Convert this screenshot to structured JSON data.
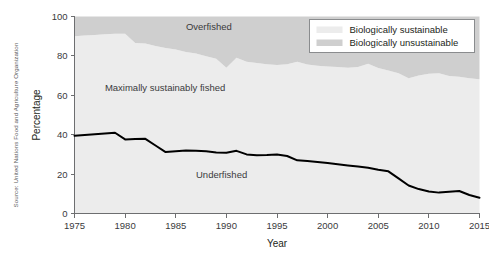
{
  "chart_data": {
    "type": "area",
    "title": "",
    "xlabel": "Year",
    "ylabel": "Percentage",
    "xlim": [
      1975,
      2015
    ],
    "ylim": [
      0,
      100
    ],
    "xticks": [
      1975,
      1980,
      1985,
      1990,
      1995,
      2000,
      2005,
      2010,
      2015
    ],
    "yticks": [
      0,
      20,
      40,
      60,
      80,
      100
    ],
    "grid": false,
    "legend_position": "top-right",
    "source": "Source: United Nations Food and Agriculture Organization",
    "legend": [
      {
        "label": "Biologically sustainable",
        "color": "#ececec"
      },
      {
        "label": "Biologically unsustainable",
        "color": "#cfcfcf"
      }
    ],
    "area_labels": [
      {
        "text": "Overfished",
        "x": 1986,
        "y": 93
      },
      {
        "text": "Maximally sustainably fished",
        "x": 1978,
        "y": 62
      },
      {
        "text": "Underfished",
        "x": 1987,
        "y": 18
      }
    ],
    "x": [
      1975,
      1976,
      1977,
      1978,
      1979,
      1980,
      1981,
      1982,
      1983,
      1984,
      1985,
      1986,
      1987,
      1988,
      1989,
      1990,
      1991,
      1992,
      1993,
      1994,
      1995,
      1996,
      1997,
      1998,
      1999,
      2000,
      2001,
      2002,
      2003,
      2004,
      2005,
      2006,
      2007,
      2008,
      2009,
      2010,
      2011,
      2012,
      2013,
      2014,
      2015
    ],
    "series": [
      {
        "name": "Underfished (upper boundary)",
        "style": "black-line",
        "values": [
          39.5,
          39.8,
          40.2,
          40.6,
          41.0,
          37.6,
          37.8,
          37.9,
          34.5,
          31.2,
          31.6,
          32.0,
          31.8,
          31.6,
          31.0,
          30.8,
          31.8,
          30.0,
          29.6,
          29.7,
          30.0,
          29.2,
          27.0,
          26.6,
          26.2,
          25.6,
          25.0,
          24.4,
          23.8,
          23.2,
          22.2,
          21.4,
          17.8,
          14.2,
          12.4,
          11.2,
          10.6,
          11.0,
          11.4,
          9.4,
          8.0
        ]
      },
      {
        "name": "Maximally sustainably fished (upper boundary)",
        "style": "light-area",
        "values": [
          90.0,
          90.3,
          90.6,
          91.0,
          91.2,
          91.3,
          86.5,
          86.3,
          85.0,
          84.0,
          83.2,
          82.0,
          81.2,
          79.8,
          78.6,
          74.0,
          79.0,
          77.0,
          76.4,
          75.8,
          75.4,
          75.8,
          77.0,
          75.6,
          75.0,
          74.6,
          74.4,
          74.0,
          74.4,
          76.0,
          73.8,
          72.6,
          71.2,
          68.6,
          70.0,
          71.0,
          71.2,
          69.8,
          69.4,
          68.6,
          68.2
        ]
      },
      {
        "name": "Overfished (to 100%)",
        "style": "dark-area",
        "values": [
          100,
          100,
          100,
          100,
          100,
          100,
          100,
          100,
          100,
          100,
          100,
          100,
          100,
          100,
          100,
          100,
          100,
          100,
          100,
          100,
          100,
          100,
          100,
          100,
          100,
          100,
          100,
          100,
          100,
          100,
          100,
          100,
          100,
          100,
          100,
          100,
          100,
          100,
          100,
          100,
          100
        ]
      }
    ]
  }
}
